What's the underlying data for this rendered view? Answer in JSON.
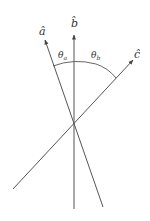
{
  "diagram": {
    "colors": {
      "line": "#555555",
      "text": "#333333",
      "background": "#ffffff"
    },
    "vectors": [
      {
        "id": "a",
        "label": "â",
        "tail": [
          103,
          207
        ],
        "head": [
          45,
          40
        ]
      },
      {
        "id": "b",
        "label": "b̂",
        "tail": [
          74,
          209
        ],
        "head": [
          74,
          35
        ]
      },
      {
        "id": "c",
        "label": "ĉ",
        "tail": [
          13,
          189
        ],
        "head": [
          133,
          60
        ]
      }
    ],
    "labels": {
      "a_hat": "â",
      "b_hat": "b̂",
      "c_hat": "ĉ",
      "theta_a": "θ",
      "theta_a_sub": "a",
      "theta_b": "θ",
      "theta_b_sub": "b"
    },
    "intersection": [
      74,
      124
    ]
  }
}
